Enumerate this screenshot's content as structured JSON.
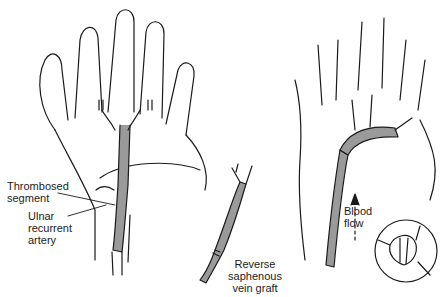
{
  "figure": {
    "panels": [
      {
        "id": "left-hand",
        "description": "Palmar view of hand showing thrombosed ulnar artery segment"
      },
      {
        "id": "graft",
        "description": "Reverse saphenous vein graft"
      },
      {
        "id": "right-hand",
        "description": "Hand after graft placement with blood flow arrow and inset anastomosis"
      }
    ],
    "labels": {
      "thrombosed_1": "Thrombosed",
      "thrombosed_2": "segment",
      "ulnar_1": "Ulnar",
      "ulnar_2": "recurrent",
      "ulnar_3": "artery",
      "graft_1": "Reverse",
      "graft_2": "saphenous",
      "graft_3": "vein graft",
      "blood_1": "Blood",
      "blood_2": "flow"
    },
    "colors": {
      "line": "#1a1a1a",
      "vessel_fill": "#9a9a9a",
      "background": "#ffffff"
    }
  }
}
